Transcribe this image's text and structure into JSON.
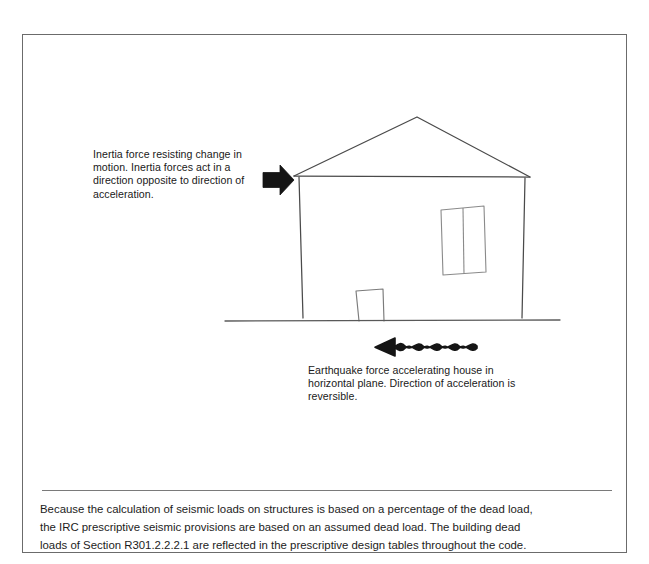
{
  "figure": {
    "border_color": "#6b6b6b",
    "background": "#ffffff",
    "line_color": "#4a4a4a",
    "ink_color": "#111111"
  },
  "annotations": {
    "inertia_note": "Inertia force resisting change in motion. Inertia forces act in a direction opposite to direction of acceleration.",
    "earthquake_note": "Earthquake force accelerating house in horizontal plane. Direction of acceleration is reversible."
  },
  "icons": {
    "inertia_arrow": "right-arrow-icon",
    "earthquake_arrow": "wavy-left-arrow-icon"
  },
  "drawing": {
    "title": "house-elevation-seismic-diagram",
    "parts": [
      "roof-gable",
      "left-wall",
      "right-wall",
      "door",
      "window",
      "ground-line"
    ]
  },
  "caption": {
    "line1": "Because the calculation of seismic loads on structures is based on a percentage of the dead load,",
    "line2": "the IRC prescriptive seismic provisions are based on an assumed dead load. The building dead",
    "line3": "loads of Section R301.2.2.2.1 are reflected in the prescriptive design tables throughout the code.",
    "section_reference": "R301.2.2.2.1"
  }
}
